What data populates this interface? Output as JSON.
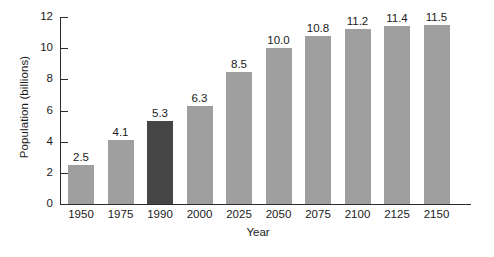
{
  "chart_data": {
    "type": "bar",
    "title": "",
    "subtitle": "",
    "xlabel": "Year",
    "ylabel": "Population (billions)",
    "categories": [
      "1950",
      "1975",
      "1990",
      "2000",
      "2025",
      "2050",
      "2075",
      "2100",
      "2125",
      "2150"
    ],
    "values": [
      2.5,
      4.1,
      5.3,
      6.3,
      8.5,
      10.0,
      10.8,
      11.2,
      11.4,
      11.5
    ],
    "value_labels": [
      "2.5",
      "4.1",
      "5.3",
      "6.3",
      "8.5",
      "10.0",
      "10.8",
      "11.2",
      "11.4",
      "11.5"
    ],
    "ylim": [
      0,
      12
    ],
    "xlim": null,
    "y_ticks": [
      0,
      2,
      4,
      6,
      8,
      10,
      12
    ],
    "y_tick_labels": [
      "0",
      "2",
      "4",
      "6",
      "8",
      "10",
      "12"
    ],
    "grid": false,
    "legend": null,
    "legend_position": "none",
    "bar_color": "#9f9f9f",
    "highlight_color": "#454545",
    "highlighted_categories": [
      "1990"
    ],
    "axis_color": "#2a2a2a",
    "background_color": "#ffffff",
    "show_value_labels": true
  }
}
